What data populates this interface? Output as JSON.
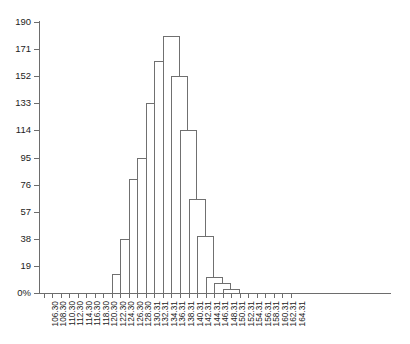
{
  "chart_data": {
    "type": "bar",
    "title": "",
    "subtitle": "",
    "xlabel": "",
    "ylabel": "",
    "grid": false,
    "legend": false,
    "ylim": [
      0,
      190
    ],
    "y_ticks": [
      "0%",
      "19",
      "38",
      "57",
      "76",
      "95",
      "114",
      "133",
      "152",
      "171",
      "190"
    ],
    "y_tick_values": [
      0,
      19,
      38,
      57,
      76,
      95,
      114,
      133,
      152,
      171,
      190
    ],
    "categories": [
      "106.30",
      "108.30",
      "110.30",
      "112.30",
      "114.30",
      "116.30",
      "118.30",
      "120.30",
      "122.30",
      "124.30",
      "126.30",
      "128.30",
      "130.31",
      "132.31",
      "134.31",
      "136.31",
      "138.31",
      "140.31",
      "142.31",
      "144.31",
      "146.31",
      "148.31",
      "150.31",
      "152.31",
      "154.31",
      "156.31",
      "158.31",
      "160.31",
      "162.31",
      "164.31"
    ],
    "bars": [
      {
        "category": "122.30",
        "value": 13
      },
      {
        "category": "124.30",
        "value": 38
      },
      {
        "category": "126.30",
        "value": 80
      },
      {
        "category": "128.30",
        "value": 95
      },
      {
        "category": "130.31",
        "value": 133
      },
      {
        "category": "132.31",
        "value": 163
      },
      {
        "category": "134.31",
        "value": 180
      },
      {
        "category": "136.31",
        "value": 152
      },
      {
        "category": "138.31",
        "value": 114
      },
      {
        "category": "140.31",
        "value": 66
      },
      {
        "category": "142.31",
        "value": 40
      },
      {
        "category": "144.31",
        "value": 11
      },
      {
        "category": "146.31",
        "value": 7
      },
      {
        "category": "148.31",
        "value": 3
      }
    ],
    "values": [
      0,
      0,
      0,
      0,
      0,
      0,
      0,
      0,
      13,
      38,
      80,
      95,
      133,
      163,
      180,
      152,
      114,
      66,
      40,
      11,
      7,
      3,
      0,
      0,
      0,
      0,
      0,
      0,
      0,
      0
    ],
    "colors": {
      "bar_fill": "#ffffff",
      "bar_stroke": "#707070",
      "axis": "#6d6d6d",
      "text": "#1c1c1c",
      "background": "#ffffff"
    }
  }
}
